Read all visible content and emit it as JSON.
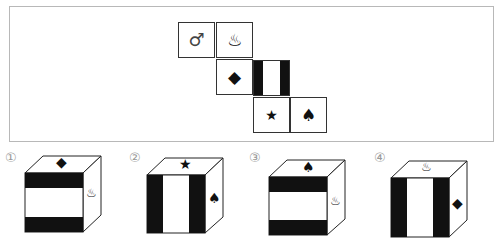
{
  "question": {
    "net": {
      "faces": [
        {
          "id": "male",
          "symbol": "♂",
          "row": 0,
          "col": 0
        },
        {
          "id": "hot-spring",
          "symbol": "♨",
          "row": 0,
          "col": 1
        },
        {
          "id": "diamond",
          "symbol": "◆",
          "row": 1,
          "col": 1
        },
        {
          "id": "stripes",
          "symbol": "",
          "row": 1,
          "col": 2,
          "pattern": "vertical-stripes"
        },
        {
          "id": "star",
          "symbol": "★",
          "row": 2,
          "col": 2
        },
        {
          "id": "spade",
          "symbol": "♠",
          "row": 2,
          "col": 3
        }
      ]
    }
  },
  "options": [
    {
      "label": "①",
      "top": "◆",
      "right": "♨",
      "front_pattern": "horizontal-stripes"
    },
    {
      "label": "②",
      "top": "★",
      "right": "♠",
      "front_pattern": "vertical-stripes"
    },
    {
      "label": "③",
      "top": "♠",
      "right": "♨",
      "front_pattern": "horizontal-stripes"
    },
    {
      "label": "④",
      "top": "♨",
      "right": "◆",
      "front_pattern": "vertical-stripes"
    }
  ]
}
